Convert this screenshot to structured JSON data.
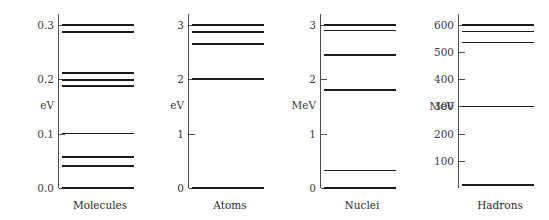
{
  "figure": {
    "background_color": "#ffffff",
    "level_color": "#1c1c1c",
    "axis_color": "#4a4a4a"
  },
  "chart_data": {
    "type": "line",
    "title": "",
    "subtitle": "",
    "xlabel": "",
    "ylabel": "",
    "grid": false,
    "legend": "none",
    "panels": [
      {
        "name": "molecules",
        "caption": "Molecules",
        "unit": "eV",
        "ylim": [
          0.0,
          0.32
        ],
        "ticks": [
          {
            "value": 0.0,
            "label": "0.0"
          },
          {
            "value": 0.1,
            "label": "0.1"
          },
          {
            "value": 0.2,
            "label": "0.2"
          },
          {
            "value": 0.3,
            "label": "0.3"
          }
        ],
        "levels": [
          0.0,
          0.04,
          0.057,
          0.1,
          0.188,
          0.199,
          0.212,
          0.287,
          0.3
        ]
      },
      {
        "name": "atoms",
        "caption": "Atoms",
        "unit": "eV",
        "ylim": [
          0.0,
          3.2
        ],
        "ticks": [
          {
            "value": 0,
            "label": "0"
          },
          {
            "value": 1,
            "label": "1"
          },
          {
            "value": 2,
            "label": "2"
          },
          {
            "value": 3,
            "label": "3"
          }
        ],
        "levels": [
          0.0,
          2.0,
          2.65,
          2.87,
          3.0
        ]
      },
      {
        "name": "nuclei",
        "caption": "Nuclei",
        "unit": "MeV",
        "ylim": [
          0.0,
          3.2
        ],
        "ticks": [
          {
            "value": 0,
            "label": "0"
          },
          {
            "value": 1,
            "label": "1"
          },
          {
            "value": 2,
            "label": "2"
          },
          {
            "value": 3,
            "label": "3"
          }
        ],
        "levels": [
          0.0,
          0.32,
          1.8,
          2.45,
          2.9,
          3.0
        ]
      },
      {
        "name": "hadrons",
        "caption": "Hadrons",
        "unit": "MeV",
        "ylim": [
          0,
          640
        ],
        "ticks": [
          {
            "value": 100,
            "label": "100"
          },
          {
            "value": 200,
            "label": "200"
          },
          {
            "value": 300,
            "label": "300"
          },
          {
            "value": 400,
            "label": "400"
          },
          {
            "value": 500,
            "label": "500"
          },
          {
            "value": 600,
            "label": "600"
          }
        ],
        "levels": [
          10,
          300,
          535,
          575,
          600
        ]
      }
    ]
  }
}
